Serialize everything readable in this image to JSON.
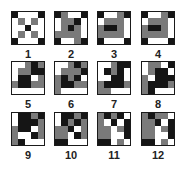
{
  "figure": {
    "colors": {
      "white": "#ffffff",
      "black": "#151515",
      "gray": "#7a7a7a",
      "border": "#1a1a1a"
    },
    "grid_size": 5,
    "patterns": [
      {
        "label": "1",
        "cells": [
          "BWWWB",
          "WGWGW",
          "WWBWW",
          "WGWGW",
          "BWWWB"
        ]
      },
      {
        "label": "2",
        "cells": [
          "BGWWB",
          "WGGBW",
          "WGBGW",
          "GGGGW",
          "BWWGB"
        ]
      },
      {
        "label": "3",
        "cells": [
          "BWWGB",
          "WGGGW",
          "GBBGW",
          "GGGGW",
          "BWWWB"
        ]
      },
      {
        "label": "4",
        "cells": [
          "BWWGB",
          "WGGGW",
          "GBBGW",
          "GGGGW",
          "BWWWB"
        ]
      },
      {
        "label": "5",
        "cells": [
          "WWGBG",
          "WGGBB",
          "WBBWG",
          "GBBGG",
          "WWWWW"
        ]
      },
      {
        "label": "6",
        "cells": [
          "WWGBG",
          "WGGGB",
          "GBGBW",
          "GBBGG",
          "GWWWW"
        ]
      },
      {
        "label": "7",
        "cells": [
          "WWGBB",
          "WBGBW",
          "WWBBW",
          "GBBBG",
          "GGWWW"
        ]
      },
      {
        "label": "8",
        "cells": [
          "WGGWB",
          "WGBBW",
          "GWBBB",
          "GBBBG",
          "GBWWW"
        ]
      },
      {
        "label": "9",
        "cells": [
          "WBBGB",
          "WBBBG",
          "GBBWG",
          "GWWBG",
          "GBWWW"
        ]
      },
      {
        "label": "10",
        "cells": [
          "WBBGB",
          "WBGBG",
          "GGBWG",
          "GGWBG",
          "BBWWW"
        ]
      },
      {
        "label": "11",
        "cells": [
          "GBGBW",
          "GWBWB",
          "GGWGB",
          "GGWWB",
          "BBWGW"
        ]
      },
      {
        "label": "12",
        "cells": [
          "GBGGW",
          "GGBWB",
          "GGWGB",
          "GGWWB",
          "BBWGW"
        ]
      }
    ]
  }
}
